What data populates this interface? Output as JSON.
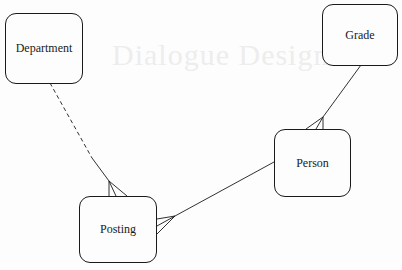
{
  "diagram": {
    "type": "entity-relationship",
    "entities": [
      {
        "id": "department",
        "label": "Department"
      },
      {
        "id": "grade",
        "label": "Grade"
      },
      {
        "id": "person",
        "label": "Person"
      },
      {
        "id": "posting",
        "label": "Posting"
      }
    ],
    "relationships": [
      {
        "from": "department",
        "to": "posting",
        "from_end": "one",
        "to_end": "many",
        "style": "dashed-to-solid",
        "description": "Department optionally has many Postings"
      },
      {
        "from": "grade",
        "to": "person",
        "from_end": "one",
        "to_end": "many",
        "style": "solid"
      },
      {
        "from": "person",
        "to": "posting",
        "from_end": "one",
        "to_end": "many",
        "style": "solid"
      }
    ]
  },
  "background_bleedthrough": {
    "title": "Dialogue Design"
  }
}
